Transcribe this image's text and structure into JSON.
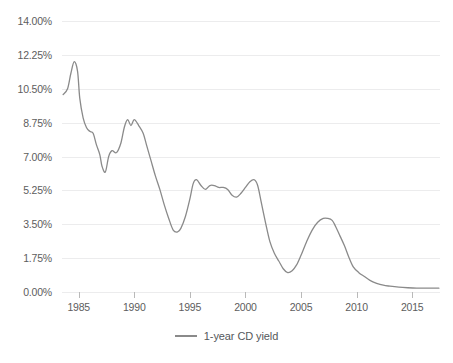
{
  "chart_data": {
    "type": "line",
    "title": "",
    "subtitle": "",
    "xlabel": "",
    "ylabel": "",
    "grid": true,
    "legend_position": "bottom",
    "xlim": [
      1983.5,
      2017.5
    ],
    "ylim": [
      0.0,
      14.0
    ],
    "y_ticks": [
      0.0,
      1.75,
      3.5,
      5.25,
      7.0,
      8.75,
      10.5,
      12.25,
      14.0
    ],
    "y_tick_labels": [
      "0.00%",
      "1.75%",
      "3.50%",
      "5.25%",
      "7.00%",
      "8.75%",
      "10.50%",
      "12.25%",
      "14.00%"
    ],
    "x_ticks": [
      1985,
      1990,
      1995,
      2000,
      2005,
      2010,
      2015
    ],
    "x_tick_labels": [
      "1985",
      "1990",
      "1995",
      "2000",
      "2005",
      "2010",
      "2015"
    ],
    "line_color": "#8a8a8a",
    "series": [
      {
        "name": "1-year CD yield",
        "x": [
          1983.6,
          1984.0,
          1984.3,
          1984.6,
          1984.9,
          1985.1,
          1985.4,
          1985.7,
          1986.0,
          1986.3,
          1986.6,
          1986.9,
          1987.1,
          1987.4,
          1987.7,
          1988.0,
          1988.4,
          1988.8,
          1989.1,
          1989.4,
          1989.7,
          1990.0,
          1990.4,
          1990.8,
          1991.1,
          1991.5,
          1991.9,
          1992.3,
          1992.7,
          1993.1,
          1993.5,
          1993.9,
          1994.2,
          1994.6,
          1995.0,
          1995.3,
          1995.6,
          1996.0,
          1996.4,
          1996.8,
          1997.2,
          1997.6,
          1998.0,
          1998.4,
          1998.8,
          1999.2,
          1999.6,
          2000.0,
          2000.4,
          2000.8,
          2001.1,
          2001.4,
          2001.8,
          2002.2,
          2002.6,
          2003.0,
          2003.4,
          2003.8,
          2004.2,
          2004.6,
          2005.0,
          2005.5,
          2006.0,
          2006.5,
          2007.0,
          2007.4,
          2007.8,
          2008.1,
          2008.5,
          2008.9,
          2009.3,
          2009.7,
          2010.2,
          2010.7,
          2011.2,
          2011.8,
          2012.4,
          2013.0,
          2013.8,
          2014.6,
          2015.4,
          2016.2,
          2017.0,
          2017.4
        ],
        "y": [
          10.2,
          10.5,
          11.3,
          11.9,
          11.4,
          10.0,
          9.0,
          8.5,
          8.3,
          8.2,
          7.6,
          7.1,
          6.5,
          6.2,
          7.0,
          7.3,
          7.2,
          7.7,
          8.5,
          8.9,
          8.6,
          8.9,
          8.6,
          8.2,
          7.6,
          6.8,
          6.0,
          5.3,
          4.5,
          3.8,
          3.2,
          3.1,
          3.3,
          3.9,
          4.8,
          5.6,
          5.8,
          5.5,
          5.3,
          5.5,
          5.5,
          5.4,
          5.4,
          5.3,
          5.0,
          4.9,
          5.1,
          5.4,
          5.7,
          5.8,
          5.5,
          4.7,
          3.6,
          2.6,
          2.0,
          1.6,
          1.2,
          1.0,
          1.1,
          1.4,
          1.9,
          2.6,
          3.2,
          3.6,
          3.8,
          3.8,
          3.7,
          3.4,
          2.9,
          2.4,
          1.8,
          1.3,
          1.0,
          0.8,
          0.6,
          0.45,
          0.35,
          0.3,
          0.25,
          0.22,
          0.2,
          0.2,
          0.2,
          0.2
        ]
      }
    ]
  },
  "legend": {
    "items": [
      {
        "label": "1-year CD yield",
        "color": "#8a8a8a"
      }
    ]
  }
}
